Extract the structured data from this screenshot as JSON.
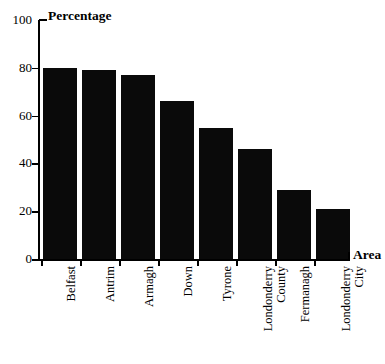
{
  "chart_data": {
    "type": "bar",
    "title": "",
    "ylabel": "Percentage",
    "xlabel": "Area",
    "ylim": [
      0,
      100
    ],
    "yticks": [
      0,
      20,
      40,
      60,
      80,
      100
    ],
    "grid": false,
    "legend": null,
    "bar_color": "#0a0a0a",
    "categories": [
      "Belfast",
      "Antrim",
      "Armagh",
      "Down",
      "Tyrone",
      "Londonderry County",
      "Fermanagh",
      "Londonderry City"
    ],
    "category_lines": [
      [
        "Belfast"
      ],
      [
        "Antrim"
      ],
      [
        "Armagh"
      ],
      [
        "Down"
      ],
      [
        "Tyrone"
      ],
      [
        "Londonderry",
        "County"
      ],
      [
        "Fermanagh"
      ],
      [
        "Londonderry",
        "City"
      ]
    ],
    "values": [
      80,
      79,
      77,
      66,
      55,
      46,
      29,
      21
    ]
  }
}
